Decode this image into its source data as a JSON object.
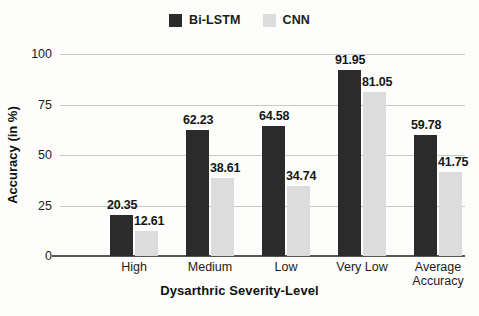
{
  "chart_data": {
    "type": "bar",
    "title": "",
    "xlabel": "Dysarthric Severity-Level",
    "ylabel": "Accuracy (in %)",
    "categories": [
      "High",
      "Medium",
      "Low",
      "Very Low",
      "Average\nAccuracy"
    ],
    "series": [
      {
        "name": "Bi-LSTM",
        "color": "#2b2b2b",
        "values": [
          20.35,
          62.23,
          64.58,
          91.95,
          59.78
        ]
      },
      {
        "name": "CNN",
        "color": "#dcdcdc",
        "values": [
          12.61,
          38.61,
          34.74,
          81.05,
          41.75
        ]
      }
    ],
    "ylim": [
      0,
      100
    ],
    "yticks": [
      0,
      25,
      50,
      75,
      100
    ],
    "ytick_labels": [
      "0",
      "25",
      "50",
      "75",
      "100"
    ],
    "grid": true,
    "legend_position": "top-center"
  },
  "legend": {
    "items": [
      {
        "label": "Bi-LSTM",
        "color": "#2b2b2b"
      },
      {
        "label": "CNN",
        "color": "#dcdcdc"
      }
    ]
  },
  "value_labels": {
    "bilstm": [
      "20.35",
      "62.23",
      "64.58",
      "91.95",
      "59.78"
    ],
    "cnn": [
      "12.61",
      "38.61",
      "34.74",
      "81.05",
      "41.75"
    ]
  },
  "axis": {
    "x_title": "Dysarthric Severity-Level",
    "y_title": "Accuracy (in %)",
    "y_ticks": [
      "100",
      "75",
      "50",
      "25",
      "0"
    ],
    "x_categories": [
      "High",
      "Medium",
      "Low",
      "Very Low",
      "Average\nAccuracy"
    ]
  }
}
